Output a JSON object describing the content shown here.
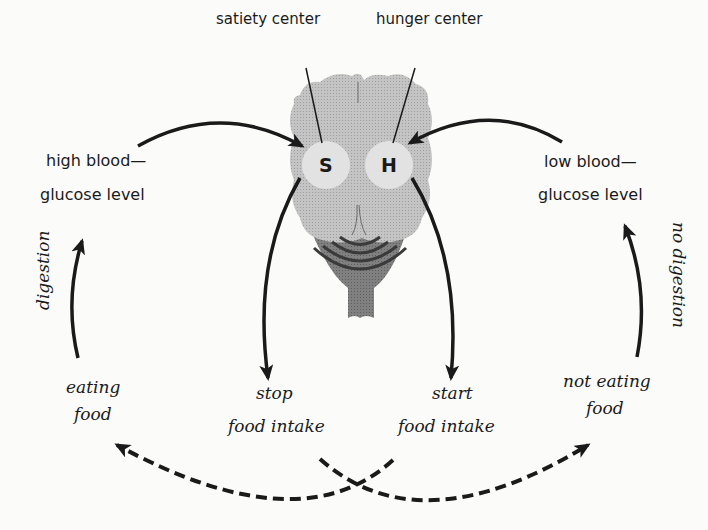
{
  "diagram": {
    "labels": {
      "satiety_center": "satiety center",
      "hunger_center": "hunger center",
      "satiety_letter": "S",
      "hunger_letter": "H",
      "high_glucose_line1": "high blood—",
      "high_glucose_line2": "glucose level",
      "low_glucose_line1": "low blood—",
      "low_glucose_line2": "glucose level",
      "digestion": "digestion",
      "no_digestion": "no digestion",
      "eating_line1": "eating",
      "eating_line2": "food",
      "stop_line1": "stop",
      "stop_line2": "food intake",
      "start_line1": "start",
      "start_line2": "food intake",
      "not_eating_line1": "not eating",
      "not_eating_line2": "food"
    },
    "colors": {
      "background": "#fbfbfa",
      "brain": "#bdbdbd",
      "center_circle": "#e2e2e2",
      "brainstem": "#7d7d7d",
      "ink": "#1a1a1a"
    }
  }
}
